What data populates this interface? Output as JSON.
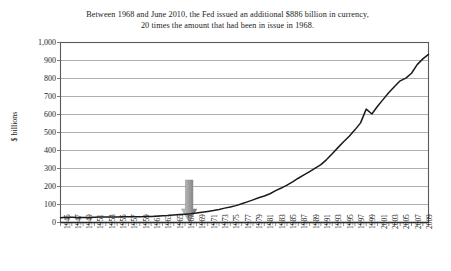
{
  "figure": {
    "title_lines": [
      "Between 1968 and June 2010, the Fed issued an additional $886 billion in currency,",
      "20 times the amount that had been in issue in 1968."
    ],
    "annotation": {
      "kind": "down-arrow",
      "points_to_year": 1968,
      "color_light": "#c9c9c9",
      "color_dark": "#6b6b6b"
    },
    "colors": {
      "line": "#1a1a1a",
      "grid": "#8c8c8c",
      "axis": "#5a5a5a",
      "background": "#ffffff"
    }
  },
  "chart_data": {
    "type": "line",
    "title": "Between 1968 and June 2010, the Fed issued an additional $886 billion in currency, 20 times the amount that had been in issue in 1968.",
    "xlabel": "",
    "ylabel": "$ billions",
    "xlim": [
      1945,
      2010
    ],
    "ylim": [
      0,
      1000
    ],
    "grid": true,
    "legend": false,
    "ytick_labels": [
      "1,000",
      "900",
      "800",
      "700",
      "600",
      "500",
      "400",
      "300",
      "200",
      "100",
      "0"
    ],
    "ytick_values": [
      1000,
      900,
      800,
      700,
      600,
      500,
      400,
      300,
      200,
      100,
      0
    ],
    "xtick_labels": [
      "1945",
      "1947",
      "1949",
      "1951",
      "1953",
      "1955",
      "1957",
      "1959",
      "1961",
      "1963",
      "1965",
      "1967",
      "1969",
      "1971",
      "1973",
      "1975",
      "1977",
      "1979",
      "1981",
      "1983",
      "1985",
      "1987",
      "1989",
      "1991",
      "1993",
      "1995",
      "1997",
      "1999",
      "2001",
      "2003",
      "2005",
      "2007",
      "2009"
    ],
    "xtick_values": [
      1945,
      1947,
      1949,
      1951,
      1953,
      1955,
      1957,
      1959,
      1961,
      1963,
      1965,
      1967,
      1969,
      1971,
      1973,
      1975,
      1977,
      1979,
      1981,
      1983,
      1985,
      1987,
      1989,
      1991,
      1993,
      1995,
      1997,
      1999,
      2001,
      2003,
      2005,
      2007,
      2009
    ],
    "minor_tick_interval": 1,
    "series": [
      {
        "name": "Currency in circulation",
        "x": [
          1945,
          1946,
          1947,
          1948,
          1949,
          1950,
          1951,
          1952,
          1953,
          1954,
          1955,
          1956,
          1957,
          1958,
          1959,
          1960,
          1961,
          1962,
          1963,
          1964,
          1965,
          1966,
          1967,
          1968,
          1969,
          1970,
          1971,
          1972,
          1973,
          1974,
          1975,
          1976,
          1977,
          1978,
          1979,
          1980,
          1981,
          1982,
          1983,
          1984,
          1985,
          1986,
          1987,
          1988,
          1989,
          1990,
          1991,
          1992,
          1993,
          1994,
          1995,
          1996,
          1997,
          1998,
          1999,
          2000,
          2001,
          2002,
          2003,
          2004,
          2005,
          2006,
          2007,
          2008,
          2009,
          2010
        ],
        "y": [
          26.5,
          28.5,
          28.9,
          28.2,
          27.6,
          27.7,
          29.2,
          30.4,
          30.8,
          30.5,
          31.2,
          31.8,
          31.8,
          32.2,
          32.6,
          32.9,
          33.9,
          35.3,
          37.1,
          39.1,
          42.1,
          44.7,
          46.5,
          48.6,
          52.6,
          57.1,
          61.6,
          66.5,
          72.5,
          79.8,
          86.6,
          93.7,
          103.8,
          114.6,
          125.6,
          137.2,
          147.4,
          159.8,
          177.4,
          191.4,
          207.5,
          226.1,
          245.9,
          264.2,
          283.1,
          302.5,
          321.4,
          349.5,
          381.9,
          416.0,
          448.5,
          479.3,
          514.7,
          553.5,
          630.0,
          603.0,
          646.0,
          684.0,
          722.0,
          756.0,
          787.0,
          802.0,
          829.0,
          877.0,
          909.0,
          934.0
        ],
        "color": "#1a1a1a",
        "marker": "none"
      }
    ],
    "notes": [
      "Sharp spike into 1999 (Y2K currency buildup) followed by a dip in 2000.",
      "Value at 1968 is approximately $49 billion; value at June 2010 is approximately $934 billion."
    ]
  }
}
